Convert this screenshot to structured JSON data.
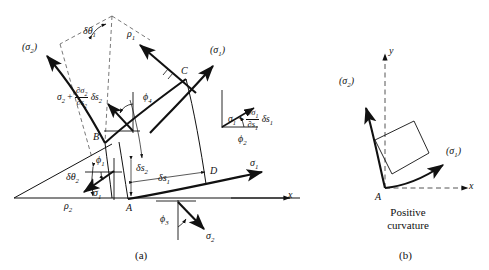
{
  "figure": {
    "panels": [
      {
        "key": "a",
        "caption": "(a)",
        "title": "Stress element on curved orthogonal coordinates"
      },
      {
        "key": "b",
        "caption": "(b)",
        "title": "Positive curvature sign convention"
      }
    ]
  },
  "panel_a": {
    "caption": "(a)",
    "points": [
      {
        "name": "A",
        "label": "A"
      },
      {
        "name": "B",
        "label": "B"
      },
      {
        "name": "C",
        "label": "C"
      },
      {
        "name": "D",
        "label": "D"
      }
    ],
    "radii": [
      {
        "name": "rho1",
        "label": "ρ",
        "sub": "1"
      },
      {
        "name": "rho2",
        "label": "ρ",
        "sub": "2"
      }
    ],
    "angles": [
      {
        "name": "delta-theta-1",
        "label": "δθ",
        "sub": "1"
      },
      {
        "name": "delta-theta-2",
        "label": "δθ",
        "sub": "2"
      },
      {
        "name": "phi1",
        "label": "ϕ",
        "sub": "1"
      },
      {
        "name": "phi2",
        "label": "ϕ",
        "sub": "2"
      },
      {
        "name": "phi3",
        "label": "ϕ",
        "sub": "3"
      },
      {
        "name": "phi4",
        "label": "ϕ",
        "sub": "4"
      }
    ],
    "arc_lengths": [
      {
        "name": "delta-s-1",
        "label": "δs",
        "sub": "1"
      },
      {
        "name": "delta-s-2",
        "label": "δs",
        "sub": "2"
      }
    ],
    "stress_directions": [
      {
        "name": "sigma1-direction",
        "label": "(σ",
        "sub": "1",
        "tail": ")"
      },
      {
        "name": "sigma2-direction",
        "label": "(σ",
        "sub": "2",
        "tail": ")"
      }
    ],
    "stresses": [
      {
        "name": "sigma1-at-B",
        "label": "σ",
        "sub": "1"
      },
      {
        "name": "sigma1-at-D",
        "label": "σ",
        "sub": "1"
      },
      {
        "name": "sigma2-at-A",
        "label": "σ",
        "sub": "2"
      }
    ],
    "incremented_stresses": [
      {
        "name": "sigma2-incremented",
        "base": "σ",
        "base_sub": "2",
        "plus": "+",
        "num": "∂σ",
        "num_sub": "2",
        "den": "∂s",
        "den_sub": "2",
        "delta": "δs",
        "delta_sub": "2"
      },
      {
        "name": "sigma1-incremented",
        "base": "σ",
        "base_sub": "1",
        "plus": "+",
        "num": "∂σ",
        "num_sub": "1",
        "den": "∂s",
        "den_sub": "1",
        "delta": "δs",
        "delta_sub": "1"
      }
    ],
    "axes": [
      {
        "name": "x-axis",
        "label": "x"
      }
    ]
  },
  "panel_b": {
    "caption": "(b)",
    "note_line1": "Positive",
    "note_line2": "curvature",
    "origin_label": "A",
    "axes": [
      {
        "name": "x-axis",
        "label": "x"
      },
      {
        "name": "y-axis",
        "label": "y"
      }
    ],
    "stress_directions": [
      {
        "name": "sigma1-direction",
        "label": "(σ",
        "sub": "1",
        "tail": ")"
      },
      {
        "name": "sigma2-direction",
        "label": "(σ",
        "sub": "2",
        "tail": ")"
      }
    ]
  },
  "style": {
    "stroke": "#111111",
    "dash": "#444444",
    "background": "#ffffff"
  }
}
